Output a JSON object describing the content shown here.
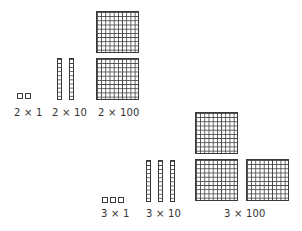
{
  "groups": [
    {
      "name": "two",
      "labels": {
        "ones": "2 × 1",
        "tens": "2 × 10",
        "hundreds": "2 × 100"
      },
      "counts": {
        "ones": 2,
        "tens": 2,
        "hundreds": 2
      }
    },
    {
      "name": "three",
      "labels": {
        "ones": "3 × 1",
        "tens": "3 × 10",
        "hundreds": "3 × 100"
      },
      "counts": {
        "ones": 3,
        "tens": 3,
        "hundreds": 3
      }
    }
  ],
  "colors": {
    "line": "#3a3a3a",
    "text": "#333333",
    "background": "#ffffff"
  }
}
